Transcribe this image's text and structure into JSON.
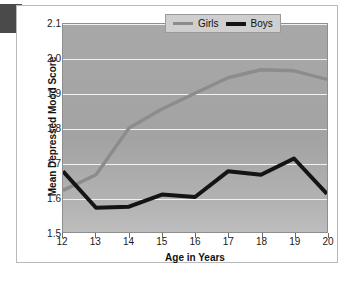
{
  "chart_data": {
    "type": "line",
    "title": "",
    "xlabel": "Age in Years",
    "ylabel": "Mean Depressed Mood Score",
    "x": [
      12,
      13,
      14,
      15,
      16,
      17,
      18,
      19,
      20
    ],
    "xticklabels": [
      "12",
      "13",
      "14",
      "15",
      "16",
      "17",
      "18",
      "19",
      "20"
    ],
    "yticklabels": [
      "1.5",
      "1.6",
      "1.7",
      "1.8",
      "1.9",
      "2.0",
      "2.1"
    ],
    "yticks": [
      1.5,
      1.6,
      1.7,
      1.8,
      1.9,
      2.0,
      2.1
    ],
    "xlim": [
      12,
      20
    ],
    "ylim": [
      1.5,
      2.1
    ],
    "grid": true,
    "legend_position": "top-right",
    "series": [
      {
        "name": "Girls",
        "color": "#8c8c8c",
        "values": [
          1.62,
          1.665,
          1.8,
          1.855,
          1.9,
          1.945,
          1.968,
          1.965,
          1.94
        ]
      },
      {
        "name": "Boys",
        "color": "#141414",
        "values": [
          1.675,
          1.57,
          1.573,
          1.608,
          1.601,
          1.675,
          1.665,
          1.712,
          1.61
        ]
      }
    ]
  },
  "legend": {
    "items": [
      {
        "label": "Girls",
        "color": "#8c8c8c"
      },
      {
        "label": "Boys",
        "color": "#141414"
      }
    ]
  },
  "page_artifacts": {
    "bleed_text": "·\n·\n·\n·\n·\n·\n·\n·"
  }
}
